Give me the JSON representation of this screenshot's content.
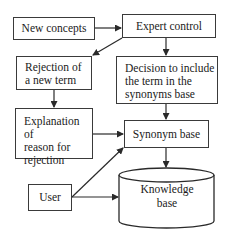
{
  "diagram": {
    "nodes": {
      "new_concepts": {
        "label": "New concepts"
      },
      "expert_control": {
        "label": "Expert control"
      },
      "rejection": {
        "label": "Rejection of\na new term"
      },
      "decision": {
        "label": "Decision to include\nthe term in the\nsynonyms base"
      },
      "explanation": {
        "label": "Explanation of\nreason for\nrejection"
      },
      "synonym_base": {
        "label": "Synonym base"
      },
      "user": {
        "label": "User"
      },
      "knowledge_base": {
        "label": "Knowledge\nbase",
        "shape": "cylinder"
      }
    },
    "edges": [
      {
        "from": "New concepts",
        "to": "Expert control"
      },
      {
        "from": "Expert control",
        "to": "Rejection of a new term"
      },
      {
        "from": "Expert control",
        "to": "Decision to include the term in the synonyms base"
      },
      {
        "from": "Rejection of a new term",
        "to": "Explanation of reason for rejection"
      },
      {
        "from": "Decision to include the term in the synonyms base",
        "to": "Synonym base"
      },
      {
        "from": "Explanation of reason for rejection",
        "to": "Synonym base"
      },
      {
        "from": "User",
        "to": "Synonym base"
      },
      {
        "from": "User",
        "to": "Knowledge base"
      },
      {
        "from": "Synonym base",
        "to": "Knowledge base"
      }
    ],
    "colors": {
      "stroke": "#3a3a3a",
      "background": "#ffffff",
      "text": "#1a1a1a"
    }
  }
}
